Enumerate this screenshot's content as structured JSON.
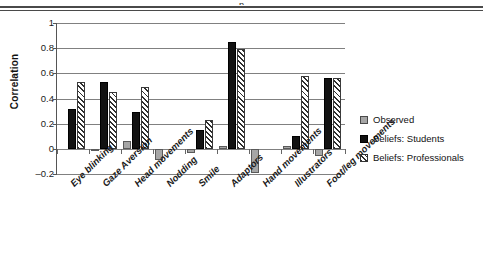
{
  "page": {
    "header_sliver_text": "p"
  },
  "legend": {
    "position": "right",
    "entries": [
      {
        "label": "Observed",
        "swatch": "observed-swatch",
        "color": "#a6a6a6"
      },
      {
        "label": "Beliefs: Students",
        "swatch": "students-swatch",
        "color": "#121212"
      },
      {
        "label": "Beliefs: Professionals",
        "swatch": "professionals-swatch",
        "color": "#ffffff"
      }
    ]
  },
  "chart_data": {
    "type": "bar",
    "title": "",
    "xlabel": "",
    "ylabel": "Correlation",
    "ylim": [
      -0.2,
      1
    ],
    "yticks": [
      1,
      0.8,
      0.6,
      0.4,
      0.2,
      0,
      -0.2
    ],
    "ytick_labels": [
      "1",
      "0.8",
      "0.6",
      "0.4",
      "0.2",
      "0",
      "–0.2"
    ],
    "grid": true,
    "categories": [
      "Eye blinking",
      "Gaze Aversion",
      "Head movements",
      "Nodding",
      "Smile",
      "Adaptors",
      "Hand movements",
      "Illustrators",
      "Foot/leg movements"
    ],
    "series": [
      {
        "name": "Observed",
        "values": [
          0,
          -0.02,
          0.06,
          -0.09,
          -0.03,
          0.02,
          -0.19,
          0.02,
          -0.06
        ]
      },
      {
        "name": "Beliefs: Students",
        "values": [
          0.32,
          0.53,
          0.29,
          0,
          0.15,
          0.85,
          0,
          0.1,
          0.56
        ]
      },
      {
        "name": "Beliefs: Professionals",
        "values": [
          0.53,
          0.45,
          0.49,
          0,
          0.23,
          0.79,
          0,
          0.58,
          0.56
        ]
      }
    ]
  }
}
